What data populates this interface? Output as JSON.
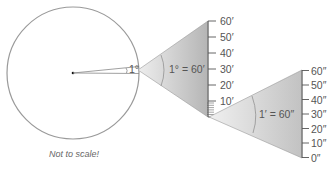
{
  "diagram": {
    "circle_angle_label": "1°",
    "degree_cone_label": "1° = 60′",
    "minute_cone_label": "1′ = 60″",
    "note": "Not to scale!",
    "arcminute_scale": {
      "ticks": [
        "60′",
        "50′",
        "40′",
        "30′",
        "20′",
        "10′",
        "0′"
      ]
    },
    "arcsecond_scale": {
      "ticks": [
        "60″",
        "50″",
        "40″",
        "30″",
        "20″",
        "10″",
        "0″"
      ]
    },
    "colors": {
      "circle_stroke": "#9a9a9a",
      "cone_fill_light": "#e6e6e6",
      "cone_fill_dark": "#b8b8b8",
      "scale_bar": "#7a7a7a",
      "text": "#555555"
    }
  }
}
